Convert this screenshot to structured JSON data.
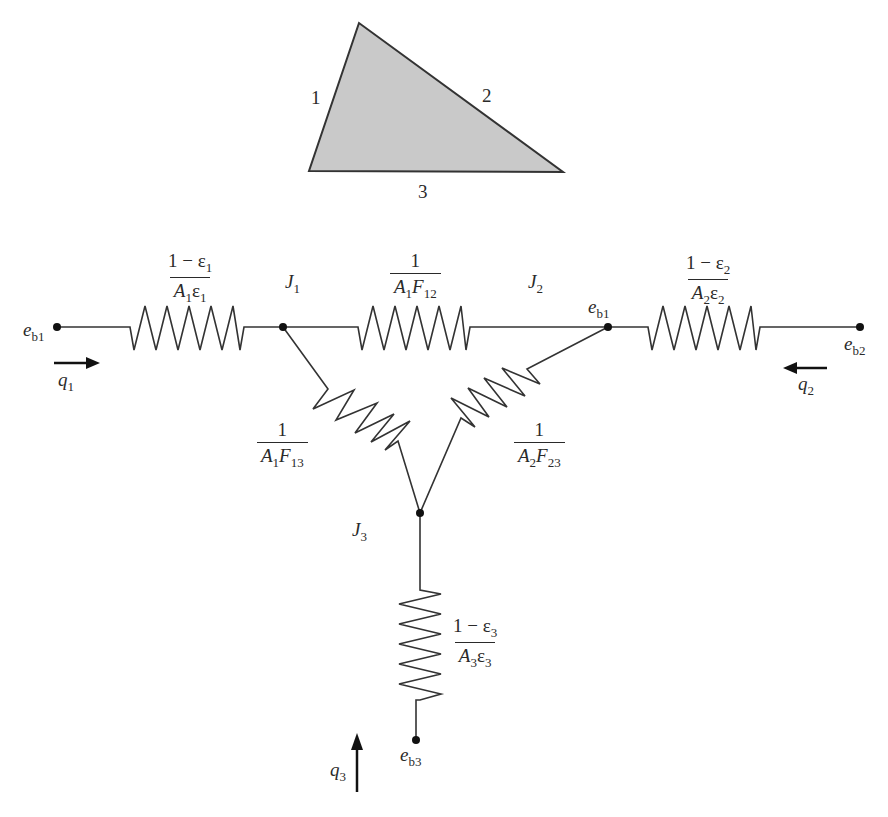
{
  "triangle": {
    "side_labels": {
      "side1": "1",
      "side2": "2",
      "side3": "3"
    },
    "fill_color": "#c9c9c9",
    "stroke_color": "#333333"
  },
  "resistors": {
    "r1": {
      "numerator": "1 − ε",
      "num_sub": "1",
      "den_a": "A",
      "den_a_sub": "1",
      "den_b": "ε",
      "den_b_sub": "1"
    },
    "r12": {
      "numerator": "1",
      "den_a": "A",
      "den_a_sub": "1",
      "den_b": "F",
      "den_b_sub": "12"
    },
    "r2": {
      "numerator": "1 − ε",
      "num_sub": "2",
      "den_a": "A",
      "den_a_sub": "2",
      "den_b": "ε",
      "den_b_sub": "2"
    },
    "r13": {
      "numerator": "1",
      "den_a": "A",
      "den_a_sub": "1",
      "den_b": "F",
      "den_b_sub": "13"
    },
    "r23": {
      "numerator": "1",
      "den_a": "A",
      "den_a_sub": "2",
      "den_b": "F",
      "den_b_sub": "23"
    },
    "r3": {
      "numerator": "1 − ε",
      "num_sub": "3",
      "den_a": "A",
      "den_a_sub": "3",
      "den_b": "ε",
      "den_b_sub": "3"
    }
  },
  "nodes": {
    "eb1_left": {
      "base": "e",
      "sub": "b1"
    },
    "eb1_right": {
      "base": "e",
      "sub": "b1"
    },
    "eb2": {
      "base": "e",
      "sub": "b2"
    },
    "eb3": {
      "base": "e",
      "sub": "b3"
    },
    "J1": {
      "base": "J",
      "sub": "1"
    },
    "J2": {
      "base": "J",
      "sub": "2"
    },
    "J3": {
      "base": "J",
      "sub": "3"
    }
  },
  "flows": {
    "q1": {
      "base": "q",
      "sub": "1",
      "direction": "right"
    },
    "q2": {
      "base": "q",
      "sub": "2",
      "direction": "left"
    },
    "q3": {
      "base": "q",
      "sub": "3",
      "direction": "up"
    }
  }
}
